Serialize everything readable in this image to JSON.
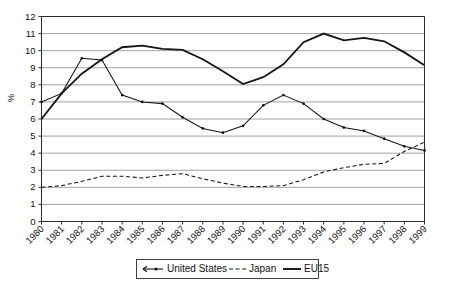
{
  "chart_data": {
    "type": "line",
    "title": "",
    "xlabel": "",
    "ylabel": "%",
    "ylim": [
      0,
      12
    ],
    "ytick_step": 1,
    "grid": true,
    "legend_position": "bottom",
    "categories": [
      "1980",
      "1981",
      "1982",
      "1983",
      "1984",
      "1985",
      "1986",
      "1987",
      "1988",
      "1989",
      "1990",
      "1991",
      "1992",
      "1993",
      "1994",
      "1995",
      "1996",
      "1997",
      "1998",
      "1999"
    ],
    "ytick_labels": [
      "0",
      "1",
      "2",
      "3",
      "4",
      "5",
      "6",
      "7",
      "8",
      "9",
      "10",
      "11",
      "12"
    ],
    "series": [
      {
        "name": "United States",
        "style": "solid-with-markers",
        "color": "#141414",
        "values": [
          7.0,
          7.5,
          9.55,
          9.45,
          7.4,
          7.0,
          6.9,
          6.1,
          5.45,
          5.2,
          5.6,
          6.8,
          7.4,
          6.9,
          6.0,
          5.5,
          5.3,
          4.85,
          4.4,
          4.15
        ]
      },
      {
        "name": "Japan",
        "style": "dashed",
        "color": "#141414",
        "values": [
          2.0,
          2.1,
          2.35,
          2.65,
          2.65,
          2.55,
          2.7,
          2.8,
          2.5,
          2.25,
          2.05,
          2.05,
          2.1,
          2.45,
          2.9,
          3.15,
          3.35,
          3.4,
          4.1,
          4.65
        ]
      },
      {
        "name": "EU15",
        "style": "solid-thick",
        "color": "#141414",
        "values": [
          6.0,
          7.5,
          8.65,
          9.5,
          10.2,
          10.3,
          10.1,
          10.05,
          9.5,
          8.8,
          8.05,
          8.45,
          9.2,
          10.5,
          11.0,
          10.6,
          10.75,
          10.55,
          9.9,
          9.15
        ]
      }
    ],
    "legend": [
      {
        "label": "United States",
        "marker": "line-with-dot"
      },
      {
        "label": "Japan",
        "marker": "dashed-line"
      },
      {
        "label": "EU15",
        "marker": "thick-line"
      }
    ]
  }
}
